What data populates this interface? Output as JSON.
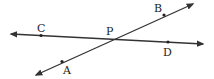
{
  "diagram": {
    "type": "intersecting-lines",
    "line_color": "#333333",
    "lines": [
      {
        "name": "line-CD",
        "x1": 11,
        "y1": 34,
        "x2": 203,
        "y2": 44
      },
      {
        "name": "line-AB",
        "x1": 36,
        "y1": 75,
        "x2": 193,
        "y2": 4
      }
    ],
    "points": [
      {
        "label": "C",
        "x": 41,
        "y": 35.5,
        "lx": 37,
        "ly": 23
      },
      {
        "label": "P",
        "x": 110.5,
        "y": 39.5,
        "lx": 106,
        "ly": 26
      },
      {
        "label": "D",
        "x": 168,
        "y": 42,
        "lx": 163,
        "ly": 47
      },
      {
        "label": "B",
        "x": 164,
        "y": 15,
        "lx": 154,
        "ly": 3
      },
      {
        "label": "A",
        "x": 62,
        "y": 61.5,
        "lx": 63,
        "ly": 65
      }
    ]
  }
}
